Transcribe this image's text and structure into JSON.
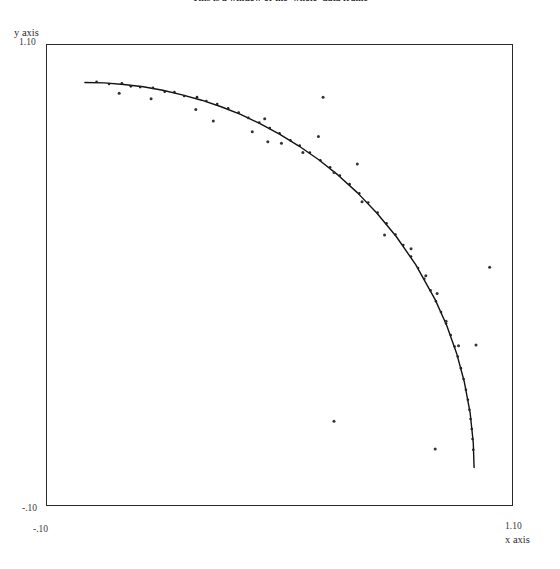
{
  "title": "This is a window of the 'whole' data frame",
  "axes": {
    "x": {
      "label": "x axis",
      "tick_min": "-.10",
      "tick_max": "1.10"
    },
    "y": {
      "label": "y axis",
      "tick_min": "-.10",
      "tick_max": "1.10"
    }
  },
  "chart_data": {
    "type": "scatter",
    "title": "This is a window of the 'whole' data frame",
    "xlabel": "x axis",
    "ylabel": "y axis",
    "xlim": [
      -0.1,
      1.1
    ],
    "ylim": [
      -0.1,
      1.1
    ],
    "xticks": [
      -0.1,
      1.1
    ],
    "yticks": [
      -0.1,
      1.1
    ],
    "xticklabels": [
      "-.10",
      "1.10"
    ],
    "yticklabels": [
      "-.10",
      "1.10"
    ],
    "grid": false,
    "legend": null,
    "frame": true,
    "series": [
      {
        "name": "unit circle arc",
        "type": "line",
        "color": "#111111",
        "linewidth": 1.4,
        "description": "Quarter arc of the unit circle x^2 + y^2 = 1 spanning the first quadrant",
        "x": [
          0.0,
          0.05,
          0.1,
          0.15,
          0.2,
          0.25,
          0.3,
          0.35,
          0.4,
          0.45,
          0.5,
          0.55,
          0.6,
          0.65,
          0.7,
          0.75,
          0.8,
          0.85,
          0.9,
          0.93,
          0.955,
          0.975,
          0.99,
          0.998,
          1.0
        ],
        "y": [
          1.0,
          0.999,
          0.995,
          0.989,
          0.98,
          0.968,
          0.954,
          0.937,
          0.917,
          0.893,
          0.866,
          0.835,
          0.8,
          0.76,
          0.714,
          0.661,
          0.6,
          0.527,
          0.436,
          0.368,
          0.297,
          0.222,
          0.141,
          0.063,
          0.0
        ]
      },
      {
        "name": "sampled points",
        "type": "scatter",
        "color": "#222222",
        "marker": "dot",
        "markersize": 1.3,
        "description": "Small points sampled along the arc with slight radial noise",
        "x": [
          0.03,
          0.062,
          0.095,
          0.118,
          0.142,
          0.175,
          0.205,
          0.23,
          0.255,
          0.288,
          0.312,
          0.34,
          0.368,
          0.395,
          0.42,
          0.448,
          0.475,
          0.5,
          0.528,
          0.552,
          0.578,
          0.605,
          0.63,
          0.655,
          0.68,
          0.705,
          0.728,
          0.752,
          0.775,
          0.798,
          0.818,
          0.838,
          0.856,
          0.872,
          0.888,
          0.902,
          0.915,
          0.928,
          0.94,
          0.95,
          0.958,
          0.966,
          0.973,
          0.979,
          0.984,
          0.988,
          0.991,
          0.994,
          0.996,
          0.998
        ],
        "y": [
          1.002,
          0.996,
          0.998,
          0.99,
          0.988,
          0.986,
          0.976,
          0.975,
          0.965,
          0.962,
          0.952,
          0.944,
          0.933,
          0.922,
          0.908,
          0.896,
          0.882,
          0.868,
          0.85,
          0.836,
          0.818,
          0.798,
          0.78,
          0.758,
          0.736,
          0.712,
          0.688,
          0.662,
          0.634,
          0.605,
          0.578,
          0.548,
          0.518,
          0.49,
          0.46,
          0.432,
          0.404,
          0.374,
          0.344,
          0.314,
          0.288,
          0.258,
          0.23,
          0.202,
          0.176,
          0.15,
          0.126,
          0.1,
          0.074,
          0.046
        ]
      },
      {
        "name": "outlier points",
        "type": "scatter",
        "color": "#333333",
        "marker": "dot",
        "markersize": 1.5,
        "description": "Scattered points lying off the arc",
        "x": [
          0.088,
          0.17,
          0.285,
          0.33,
          0.43,
          0.462,
          0.505,
          0.56,
          0.6,
          0.64,
          0.7,
          0.712,
          0.77,
          0.838,
          0.876,
          0.905,
          0.928,
          0.96,
          0.64,
          0.9,
          1.04,
          1.005,
          0.612,
          0.47
        ],
        "y": [
          0.972,
          0.958,
          0.93,
          0.9,
          0.872,
          0.906,
          0.842,
          0.818,
          0.86,
          0.766,
          0.788,
          0.69,
          0.604,
          0.568,
          0.498,
          0.452,
          0.38,
          0.316,
          0.12,
          0.048,
          0.52,
          0.318,
          0.962,
          0.846
        ]
      }
    ]
  }
}
